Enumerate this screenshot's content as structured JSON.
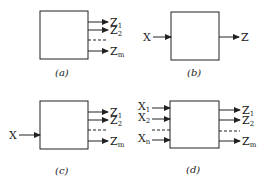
{
  "diagram": {
    "panels": [
      {
        "id": "a",
        "caption": "(a)",
        "inputs": [],
        "outputs": [
          {
            "base": "Z",
            "sub": "1"
          },
          {
            "base": "Z",
            "sub": "2"
          },
          {
            "base": "Z",
            "sub": "m"
          }
        ]
      },
      {
        "id": "b",
        "caption": "(b)",
        "inputs": [
          {
            "base": "X",
            "sub": ""
          }
        ],
        "outputs": [
          {
            "base": "Z",
            "sub": ""
          }
        ]
      },
      {
        "id": "c",
        "caption": "(c)",
        "inputs": [
          {
            "base": "X",
            "sub": ""
          }
        ],
        "outputs": [
          {
            "base": "Z",
            "sub": "1"
          },
          {
            "base": "Z",
            "sub": "2"
          },
          {
            "base": "Z",
            "sub": "m"
          }
        ]
      },
      {
        "id": "d",
        "caption": "(d)",
        "inputs": [
          {
            "base": "X",
            "sub": "1"
          },
          {
            "base": "X",
            "sub": "2"
          },
          {
            "base": "X",
            "sub": "n"
          }
        ],
        "outputs": [
          {
            "base": "Z",
            "sub": "1"
          },
          {
            "base": "Z",
            "sub": "2"
          },
          {
            "base": "Z",
            "sub": "m"
          }
        ]
      }
    ],
    "colors": {
      "stroke": "#222222",
      "background": "#ffffff"
    }
  }
}
